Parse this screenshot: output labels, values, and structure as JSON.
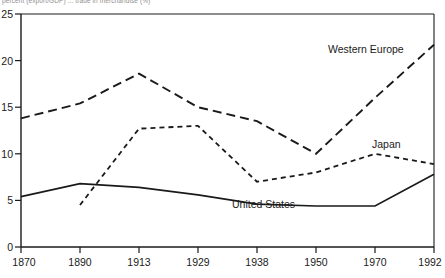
{
  "caption": {
    "top_note": "percent (export/GDP) ... trade in merchandise (%)"
  },
  "chart_data": {
    "type": "line",
    "title": "",
    "xlabel": "",
    "ylabel": "",
    "categories": [
      "1870",
      "1890",
      "1913",
      "1929",
      "1938",
      "1950",
      "1970",
      "1992"
    ],
    "ylim": [
      0,
      25
    ],
    "yticks": [
      0,
      5,
      10,
      15,
      20,
      25
    ],
    "grid": false,
    "legend_position": "inline-annotations",
    "series": [
      {
        "name": "Western Europe",
        "style": "long-dashed",
        "color": "#1a1a1a",
        "x": [
          "1870",
          "1890",
          "1913",
          "1929",
          "1938",
          "1950",
          "1970",
          "1992"
        ],
        "values": [
          13.8,
          15.4,
          18.6,
          15.0,
          13.5,
          10.0,
          16.0,
          21.7
        ]
      },
      {
        "name": "Japan",
        "style": "short-dashed",
        "color": "#1a1a1a",
        "x": [
          "1890",
          "1913",
          "1929",
          "1938",
          "1950",
          "1970",
          "1992"
        ],
        "values": [
          4.5,
          12.7,
          13.0,
          7.0,
          8.0,
          10.0,
          8.9
        ]
      },
      {
        "name": "United States",
        "style": "solid",
        "color": "#1a1a1a",
        "x": [
          "1870",
          "1890",
          "1913",
          "1929",
          "1938",
          "1950",
          "1970",
          "1992"
        ],
        "values": [
          5.4,
          6.8,
          6.4,
          5.6,
          4.6,
          4.4,
          4.4,
          7.8
        ]
      }
    ],
    "annotations": [
      {
        "text": "Western Europe",
        "near_category": "1970",
        "value": 20.5
      },
      {
        "text": "Japan",
        "near_category": "1970",
        "value": 11.4
      },
      {
        "text": "United States",
        "near_category": "1938",
        "value": 5.6
      }
    ]
  }
}
